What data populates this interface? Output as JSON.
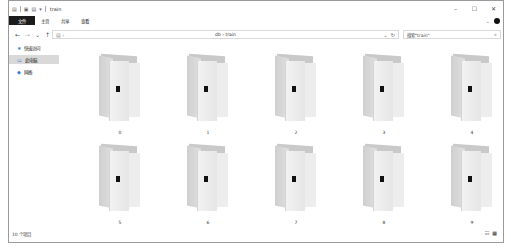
{
  "window": {
    "title": "train",
    "quick_access": [
      "system-menu-icon",
      "properties-icon",
      "new-folder-icon",
      "customize-dropdown-icon"
    ],
    "controls": {
      "minimize": "–",
      "maximize": "☐",
      "close": "✕"
    }
  },
  "ribbon": {
    "tabs": [
      {
        "label": "文件",
        "active": true
      },
      {
        "label": "主页"
      },
      {
        "label": "共享"
      },
      {
        "label": "查看"
      }
    ],
    "expand_glyph": "⌄",
    "help_color": "#111111"
  },
  "address_bar": {
    "back": "←",
    "forward": "→",
    "recent": "⌄",
    "up": "↑",
    "path": "db  ›  train",
    "dropdown": "⌄",
    "refresh": "↻"
  },
  "search": {
    "placeholder": "搜索\"train\"",
    "icon": "⌕"
  },
  "nav_pane": {
    "items": [
      {
        "label": "快速访问",
        "icon": "star-icon",
        "selected": false
      },
      {
        "label": "此电脑",
        "icon": "computer-icon",
        "selected": true
      },
      {
        "label": "网络",
        "icon": "network-icon",
        "selected": false
      }
    ]
  },
  "content": {
    "items": [
      {
        "name": "0"
      },
      {
        "name": "1"
      },
      {
        "name": "2"
      },
      {
        "name": "3"
      },
      {
        "name": "4"
      },
      {
        "name": "5"
      },
      {
        "name": "6"
      },
      {
        "name": "7"
      },
      {
        "name": "8"
      },
      {
        "name": "9"
      }
    ]
  },
  "status_bar": {
    "item_count": "10 个项目",
    "view_details": "☷",
    "view_large_icons": "▦"
  }
}
